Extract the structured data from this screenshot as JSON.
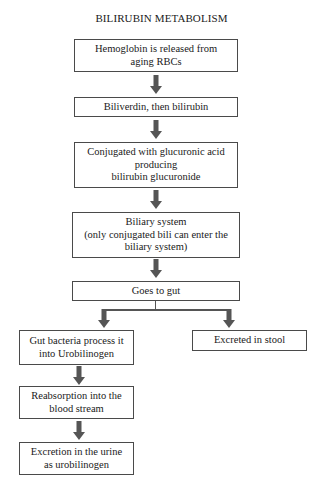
{
  "diagram": {
    "title": "BILIRUBIN METABOLISM",
    "colors": {
      "border": "#4a4a4a",
      "arrow": "#555555",
      "text": "#1a1a1a",
      "background": "#ffffff"
    },
    "steps": [
      {
        "id": "hemoglobin",
        "lines": [
          "Hemoglobin is released from",
          "aging RBCs"
        ]
      },
      {
        "id": "biliverdin",
        "lines": [
          "Biliverdin, then bilirubin"
        ]
      },
      {
        "id": "conjugated",
        "lines": [
          "Conjugated with glucuronic acid",
          "producing",
          "bilirubin glucuronide"
        ]
      },
      {
        "id": "biliary",
        "lines": [
          "Biliary system",
          "(only conjugated bili can enter the",
          "biliary system)"
        ]
      },
      {
        "id": "gut",
        "lines": [
          "Goes to gut"
        ]
      }
    ],
    "branches": {
      "left": [
        {
          "id": "bacteria",
          "lines": [
            "Gut bacteria process it",
            "into Urobilinogen"
          ]
        },
        {
          "id": "reabsorption",
          "lines": [
            "Reabsorption into the",
            "blood stream"
          ]
        },
        {
          "id": "urine",
          "lines": [
            "Excretion in the urine",
            "as urobilinogen"
          ]
        }
      ],
      "right": [
        {
          "id": "stool",
          "lines": [
            "Excreted in stool"
          ]
        }
      ]
    }
  }
}
